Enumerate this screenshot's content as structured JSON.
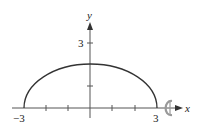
{
  "diagram": {
    "type": "plot",
    "axes": {
      "x_label": "x",
      "y_label": "y",
      "x_ticks": [
        -3,
        -2,
        -1,
        0,
        1,
        2,
        3
      ],
      "x_tick_labels": {
        "left": "−3",
        "right": "3"
      },
      "y_ticks": [
        1,
        2,
        3
      ],
      "y_tick_label": "3"
    },
    "curve": {
      "shape": "half-ellipse",
      "x_range": [
        -3,
        3
      ],
      "peak_y": 2
    },
    "rotation_symbol": "rotation-about-x-axis",
    "colors": {
      "curve": "#333333",
      "axes": "#555555",
      "rotation_arrow": "#999999"
    }
  }
}
